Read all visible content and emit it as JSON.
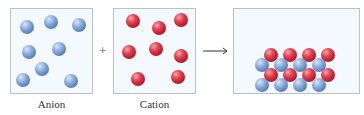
{
  "panels": [
    {
      "id": "anion",
      "label": "Anion",
      "color": "#6f93cc"
    },
    {
      "id": "cation",
      "label": "Cation",
      "color": "#d22f41"
    },
    {
      "id": "product",
      "label": "",
      "description": "Ionic solid lattice of alternating anions and cations"
    }
  ],
  "operators": {
    "plus": "+",
    "arrow": "→"
  },
  "anion_spheres": [
    [
      27,
      27
    ],
    [
      51,
      22
    ],
    [
      79,
      25
    ],
    [
      29,
      52
    ],
    [
      59,
      49
    ],
    [
      42,
      69
    ],
    [
      23,
      80
    ],
    [
      71,
      81
    ]
  ],
  "cation_spheres": [
    [
      133,
      21
    ],
    [
      159,
      28
    ],
    [
      181,
      20
    ],
    [
      129,
      52
    ],
    [
      156,
      49
    ],
    [
      181,
      56
    ],
    [
      138,
      79
    ],
    [
      178,
      77
    ]
  ],
  "lattice": {
    "blue_rows": [
      {
        "y": 65,
        "x": [
          262,
          281,
          300,
          319
        ]
      },
      {
        "y": 85,
        "x": [
          262,
          281,
          300,
          319
        ]
      }
    ],
    "red_rows": [
      {
        "y": 55,
        "x": [
          271,
          290,
          309,
          328
        ]
      },
      {
        "y": 75,
        "x": [
          271,
          290,
          309,
          328
        ]
      }
    ]
  },
  "colors": {
    "box_fill": "#f3f9fc",
    "box_border": "#b9c2c6",
    "anion": "#6f93cc",
    "cation": "#d22f41"
  }
}
